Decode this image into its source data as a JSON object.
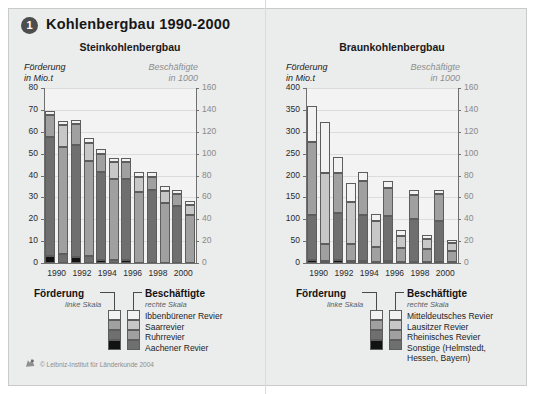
{
  "header": {
    "badge": "1",
    "title": "Kohlenbergbau 1990-2000"
  },
  "footer": {
    "copyright": "© Leibniz-Institut für Länderkunde 2004",
    "logo_icon": "leibniz-logo-icon"
  },
  "palette": {
    "lightest": "#f2f2f2",
    "light": "#c7c7c7",
    "mid": "#a0a0a0",
    "dark": "#6f6f6f",
    "darkest": "#121212",
    "plot_bg": "#f3f3f3",
    "panel_bg": "#ebecec",
    "axis": "#6f6f6f",
    "grid": "#dcdcdc",
    "right_axis_text": "#8a8a8a"
  },
  "charts": [
    {
      "id": "steinkohlenbergbau",
      "subtitle": "Steinkohlenbergbau",
      "left_axis": {
        "caption_line1": "Förderung",
        "caption_line2": "in Mio.t",
        "ticks": [
          "0",
          "10",
          "20",
          "30",
          "40",
          "50",
          "60",
          "70",
          "80"
        ],
        "min": 0,
        "max": 80
      },
      "right_axis": {
        "caption_line1": "Beschäftigte",
        "caption_line2": "in 1000",
        "ticks": [
          "0",
          "20",
          "40",
          "60",
          "80",
          "100",
          "120",
          "140",
          "160"
        ],
        "min": 0,
        "max": 160
      },
      "years": [
        "1990",
        "1992",
        "1994",
        "1996",
        "1998",
        "2000"
      ],
      "legend": {
        "left_title": "Förderung",
        "left_sub": "linke Skala",
        "right_title": "Beschäftigte",
        "right_sub": "rechte Skala",
        "items": [
          "Ibbenbürener Revier",
          "Saarrevier",
          "Ruhrrevier",
          "Aachener Revier"
        ]
      }
    },
    {
      "id": "braunkohlenbergbau",
      "subtitle": "Braunkohlenbergbau",
      "left_axis": {
        "caption_line1": "Förderung",
        "caption_line2": "in Mio.t",
        "ticks": [
          "0",
          "50",
          "100",
          "150",
          "200",
          "250",
          "300",
          "350",
          "400"
        ],
        "min": 0,
        "max": 400
      },
      "right_axis": {
        "caption_line1": "Beschäftigte",
        "caption_line2": "in 1000",
        "ticks": [
          "0",
          "20",
          "40",
          "60",
          "80",
          "100",
          "120",
          "140",
          "160"
        ],
        "min": 0,
        "max": 160
      },
      "years": [
        "1990",
        "1992",
        "1994",
        "1996",
        "1998",
        "2000"
      ],
      "legend": {
        "left_title": "Förderung",
        "left_sub": "linke Skala",
        "right_title": "Beschäftigte",
        "right_sub": "rechte Skala",
        "items": [
          "Mitteldeutsches Revier",
          "Lausitzer Revier",
          "Rheinisches Revier",
          "Sonstige (Helmstedt,",
          "Hessen, Bayern)"
        ]
      }
    }
  ],
  "chart_data": [
    {
      "type": "bar",
      "title": "Steinkohlenbergbau",
      "subtype": "paired stacked bars, dual axis",
      "categories": [
        "1990",
        "1992",
        "1994",
        "1996",
        "1998",
        "2000"
      ],
      "xlabel": "",
      "ylabel": "Förderung in Mio.t",
      "y2label": "Beschäftigte in 1000",
      "ylim": [
        0,
        80
      ],
      "y2lim": [
        0,
        160
      ],
      "yticks": [
        0,
        10,
        20,
        30,
        40,
        50,
        60,
        70,
        80
      ],
      "y2ticks": [
        0,
        20,
        40,
        60,
        80,
        100,
        120,
        140,
        160
      ],
      "grid": true,
      "legend_position": "below",
      "stack_order_bottom_to_top": [
        "Aachener Revier",
        "Ruhrrevier",
        "Saarrevier",
        "Ibbenbürener Revier"
      ],
      "series_groups": [
        {
          "name": "Förderung (linke Skala)",
          "axis": "left",
          "stacks": [
            {
              "category": "1990",
              "total": 69.5,
              "segments": [
                {
                  "name": "Aachener Revier",
                  "value": 3.0
                },
                {
                  "name": "Ruhrrevier",
                  "value": 54.5
                },
                {
                  "name": "Saarrevier",
                  "value": 10.0
                },
                {
                  "name": "Ibbenbürener Revier",
                  "value": 2.0
                }
              ]
            },
            {
              "category": "1992",
              "total": 65.5,
              "segments": [
                {
                  "name": "Aachener Revier",
                  "value": 2.8
                },
                {
                  "name": "Ruhrrevier",
                  "value": 51.2
                },
                {
                  "name": "Saarrevier",
                  "value": 9.5
                },
                {
                  "name": "Ibbenbürener Revier",
                  "value": 2.0
                }
              ]
            },
            {
              "category": "1994",
              "total": 52.0,
              "segments": [
                {
                  "name": "Aachener Revier",
                  "value": 1.5
                },
                {
                  "name": "Ruhrrevier",
                  "value": 40.0
                },
                {
                  "name": "Saarrevier",
                  "value": 8.5
                },
                {
                  "name": "Ibbenbürener Revier",
                  "value": 2.0
                }
              ]
            },
            {
              "category": "1996",
              "total": 48.0,
              "segments": [
                {
                  "name": "Aachener Revier",
                  "value": 1.2
                },
                {
                  "name": "Ruhrrevier",
                  "value": 37.3
                },
                {
                  "name": "Saarrevier",
                  "value": 7.5
                },
                {
                  "name": "Ibbenbürener Revier",
                  "value": 2.0
                }
              ]
            },
            {
              "category": "1998",
              "total": 41.5,
              "segments": [
                {
                  "name": "Aachener Revier",
                  "value": 0.0
                },
                {
                  "name": "Ruhrrevier",
                  "value": 33.5
                },
                {
                  "name": "Saarrevier",
                  "value": 6.0
                },
                {
                  "name": "Ibbenbürener Revier",
                  "value": 2.0
                }
              ]
            },
            {
              "category": "2000",
              "total": 33.5,
              "segments": [
                {
                  "name": "Aachener Revier",
                  "value": 0.0
                },
                {
                  "name": "Ruhrrevier",
                  "value": 26.0
                },
                {
                  "name": "Saarrevier",
                  "value": 5.5
                },
                {
                  "name": "Ibbenbürener Revier",
                  "value": 2.0
                }
              ]
            }
          ]
        },
        {
          "name": "Beschäftigte (rechte Skala)",
          "axis": "right",
          "stacks": [
            {
              "category": "1990",
              "total": 130.0,
              "segments": [
                {
                  "name": "Aachener Revier",
                  "value": 8.0
                },
                {
                  "name": "Ruhrrevier",
                  "value": 98.0
                },
                {
                  "name": "Saarrevier",
                  "value": 20.0
                },
                {
                  "name": "Ibbenbürener Revier",
                  "value": 4.0
                }
              ]
            },
            {
              "category": "1992",
              "total": 114.0,
              "segments": [
                {
                  "name": "Aachener Revier",
                  "value": 6.5
                },
                {
                  "name": "Ruhrrevier",
                  "value": 86.5
                },
                {
                  "name": "Saarrevier",
                  "value": 17.0
                },
                {
                  "name": "Ibbenbürener Revier",
                  "value": 4.0
                }
              ]
            },
            {
              "category": "1994",
              "total": 96.0,
              "segments": [
                {
                  "name": "Aachener Revier",
                  "value": 3.0
                },
                {
                  "name": "Ruhrrevier",
                  "value": 74.0
                },
                {
                  "name": "Saarrevier",
                  "value": 15.0
                },
                {
                  "name": "Ibbenbürener Revier",
                  "value": 4.0
                }
              ]
            },
            {
              "category": "1996",
              "total": 83.0,
              "segments": [
                {
                  "name": "Aachener Revier",
                  "value": 0.0
                },
                {
                  "name": "Ruhrrevier",
                  "value": 65.0
                },
                {
                  "name": "Saarrevier",
                  "value": 14.0
                },
                {
                  "name": "Ibbenbürener Revier",
                  "value": 4.0
                }
              ]
            },
            {
              "category": "1998",
              "total": 70.0,
              "segments": [
                {
                  "name": "Aachener Revier",
                  "value": 0.0
                },
                {
                  "name": "Ruhrrevier",
                  "value": 55.0
                },
                {
                  "name": "Saarrevier",
                  "value": 11.0
                },
                {
                  "name": "Ibbenbürener Revier",
                  "value": 4.0
                }
              ]
            },
            {
              "category": "2000",
              "total": 57.0,
              "segments": [
                {
                  "name": "Aachener Revier",
                  "value": 0.0
                },
                {
                  "name": "Ruhrrevier",
                  "value": 44.0
                },
                {
                  "name": "Saarrevier",
                  "value": 9.0
                },
                {
                  "name": "Ibbenbürener Revier",
                  "value": 4.0
                }
              ]
            }
          ]
        }
      ]
    },
    {
      "type": "bar",
      "title": "Braunkohlenbergbau",
      "subtype": "paired stacked bars, dual axis",
      "categories": [
        "1990",
        "1992",
        "1994",
        "1996",
        "1998",
        "2000"
      ],
      "xlabel": "",
      "ylabel": "Förderung in Mio.t",
      "y2label": "Beschäftigte in 1000",
      "ylim": [
        0,
        400
      ],
      "y2lim": [
        0,
        160
      ],
      "yticks": [
        0,
        50,
        100,
        150,
        200,
        250,
        300,
        350,
        400
      ],
      "y2ticks": [
        0,
        20,
        40,
        60,
        80,
        100,
        120,
        140,
        160
      ],
      "grid": true,
      "legend_position": "below",
      "stack_order_bottom_to_top": [
        "Sonstige (Helmstedt, Hessen, Bayern)",
        "Rheinisches Revier",
        "Lausitzer Revier",
        "Mitteldeutsches Revier"
      ],
      "series_groups": [
        {
          "name": "Förderung (linke Skala)",
          "axis": "left",
          "stacks": [
            {
              "category": "1990",
              "total": 358,
              "segments": [
                {
                  "name": "Sonstige (Helmstedt, Hessen, Bayern)",
                  "value": 8
                },
                {
                  "name": "Rheinisches Revier",
                  "value": 102
                },
                {
                  "name": "Lausitzer Revier",
                  "value": 167
                },
                {
                  "name": "Mitteldeutsches Revier",
                  "value": 81
                }
              ]
            },
            {
              "category": "1992",
              "total": 243,
              "segments": [
                {
                  "name": "Sonstige (Helmstedt, Hessen, Bayern)",
                  "value": 6
                },
                {
                  "name": "Rheinisches Revier",
                  "value": 108
                },
                {
                  "name": "Lausitzer Revier",
                  "value": 91
                },
                {
                  "name": "Mitteldeutsches Revier",
                  "value": 38
                }
              ]
            },
            {
              "category": "1994",
              "total": 208,
              "segments": [
                {
                  "name": "Sonstige (Helmstedt, Hessen, Bayern)",
                  "value": 5
                },
                {
                  "name": "Rheinisches Revier",
                  "value": 104
                },
                {
                  "name": "Lausitzer Revier",
                  "value": 78
                },
                {
                  "name": "Mitteldeutsches Revier",
                  "value": 21
                }
              ]
            },
            {
              "category": "1996",
              "total": 188,
              "segments": [
                {
                  "name": "Sonstige (Helmstedt, Hessen, Bayern)",
                  "value": 4
                },
                {
                  "name": "Rheinisches Revier",
                  "value": 103
                },
                {
                  "name": "Lausitzer Revier",
                  "value": 65
                },
                {
                  "name": "Mitteldeutsches Revier",
                  "value": 16
                }
              ]
            },
            {
              "category": "1998",
              "total": 166,
              "segments": [
                {
                  "name": "Sonstige (Helmstedt, Hessen, Bayern)",
                  "value": 3
                },
                {
                  "name": "Rheinisches Revier",
                  "value": 98
                },
                {
                  "name": "Lausitzer Revier",
                  "value": 54
                },
                {
                  "name": "Mitteldeutsches Revier",
                  "value": 11
                }
              ]
            },
            {
              "category": "2000",
              "total": 168,
              "segments": [
                {
                  "name": "Sonstige (Helmstedt, Hessen, Bayern)",
                  "value": 3
                },
                {
                  "name": "Rheinisches Revier",
                  "value": 94
                },
                {
                  "name": "Lausitzer Revier",
                  "value": 61
                },
                {
                  "name": "Mitteldeutsches Revier",
                  "value": 10
                }
              ]
            }
          ]
        },
        {
          "name": "Beschäftigte (rechte Skala)",
          "axis": "right",
          "stacks": [
            {
              "category": "1990",
              "total": 129.0,
              "segments": [
                {
                  "name": "Sonstige (Helmstedt, Hessen, Bayern)",
                  "value": 2.0
                },
                {
                  "name": "Rheinisches Revier",
                  "value": 15.0
                },
                {
                  "name": "Lausitzer Revier",
                  "value": 65.0
                },
                {
                  "name": "Mitteldeutsches Revier",
                  "value": 47.0
                }
              ]
            },
            {
              "category": "1992",
              "total": 73.0,
              "segments": [
                {
                  "name": "Sonstige (Helmstedt, Hessen, Bayern)",
                  "value": 1.5
                },
                {
                  "name": "Rheinisches Revier",
                  "value": 15.5
                },
                {
                  "name": "Lausitzer Revier",
                  "value": 39.0
                },
                {
                  "name": "Mitteldeutsches Revier",
                  "value": 17.0
                }
              ]
            },
            {
              "category": "1994",
              "total": 45.0,
              "segments": [
                {
                  "name": "Sonstige (Helmstedt, Hessen, Bayern)",
                  "value": 1.0
                },
                {
                  "name": "Rheinisches Revier",
                  "value": 14.0
                },
                {
                  "name": "Lausitzer Revier",
                  "value": 23.0
                },
                {
                  "name": "Mitteldeutsches Revier",
                  "value": 7.0
                }
              ]
            },
            {
              "category": "1996",
              "total": 30.0,
              "segments": [
                {
                  "name": "Sonstige (Helmstedt, Hessen, Bayern)",
                  "value": 1.0
                },
                {
                  "name": "Rheinisches Revier",
                  "value": 13.0
                },
                {
                  "name": "Lausitzer Revier",
                  "value": 11.0
                },
                {
                  "name": "Mitteldeutsches Revier",
                  "value": 5.0
                }
              ]
            },
            {
              "category": "1998",
              "total": 26.0,
              "segments": [
                {
                  "name": "Sonstige (Helmstedt, Hessen, Bayern)",
                  "value": 0.8
                },
                {
                  "name": "Rheinisches Revier",
                  "value": 12.2
                },
                {
                  "name": "Lausitzer Revier",
                  "value": 9.0
                },
                {
                  "name": "Mitteldeutsches Revier",
                  "value": 4.0
                }
              ]
            },
            {
              "category": "2000",
              "total": 21.0,
              "segments": [
                {
                  "name": "Sonstige (Helmstedt, Hessen, Bayern)",
                  "value": 0.8
                },
                {
                  "name": "Rheinisches Revier",
                  "value": 10.2
                },
                {
                  "name": "Lausitzer Revier",
                  "value": 7.0
                },
                {
                  "name": "Mitteldeutsches Revier",
                  "value": 3.0
                }
              ]
            }
          ]
        }
      ]
    }
  ]
}
